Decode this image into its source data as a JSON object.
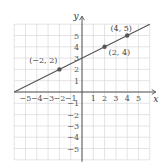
{
  "chart_data": {
    "type": "line",
    "title": "",
    "xlabel": "x",
    "ylabel": "y",
    "xlim": [
      -6,
      6
    ],
    "ylim": [
      -6,
      6
    ],
    "grid": true,
    "x_ticks": [
      "-5",
      "-4",
      "-3",
      "-2",
      "-1",
      "1",
      "2",
      "3",
      "4",
      "5"
    ],
    "y_ticks": [
      "5",
      "4",
      "3",
      "2",
      "1",
      "-1",
      "-2",
      "-3",
      "-4",
      "-5"
    ],
    "line": {
      "slope": 0.5,
      "intercept": 3,
      "x_range": [
        -6,
        6
      ]
    },
    "points": [
      {
        "x": -2,
        "y": 2,
        "label": "(−2, 2)"
      },
      {
        "x": 2,
        "y": 4,
        "label": "(2, 4)"
      },
      {
        "x": 4,
        "y": 5,
        "label": "(4, 5)"
      }
    ],
    "colors": {
      "line": "#555555",
      "grid": "#d9d9d9",
      "axis": "#555555",
      "point": "#555555"
    }
  }
}
